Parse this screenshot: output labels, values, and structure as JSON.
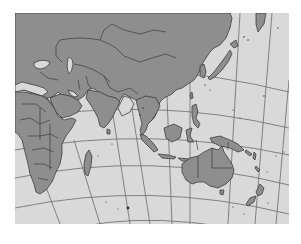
{
  "map": {
    "projection": "pseudo-conic graticule",
    "region": "Asia, Indian Ocean, Africa, Australia, Western Pacific",
    "colors": {
      "page_background": "#ffffff",
      "ocean": "#d9d9d9",
      "land": "#8e8e8e",
      "border": "#2e2e2e",
      "graticule": "#6a6a6a"
    },
    "features": [
      "Asia",
      "Europe (partial)",
      "Middle East",
      "Arabian Peninsula",
      "India",
      "China",
      "Japan",
      "Korea",
      "Southeast Asia",
      "Philippines",
      "Indonesia",
      "Papua New Guinea",
      "Africa",
      "Madagascar",
      "Australia",
      "Tasmania",
      "New Zealand",
      "Pacific islands"
    ]
  }
}
